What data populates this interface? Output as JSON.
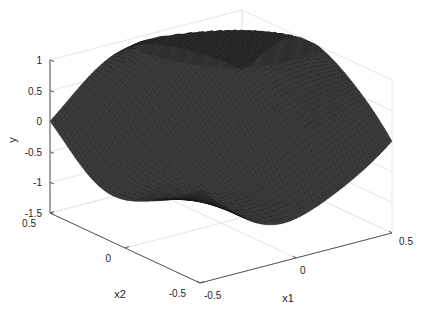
{
  "chart_data": {
    "type": "surface",
    "title": "",
    "xlabel": "x1",
    "ylabel": "x2",
    "zlabel": "y",
    "x1_range": [
      -0.5,
      0.5
    ],
    "x2_range": [
      -0.5,
      0.5
    ],
    "zlim": [
      -1.5,
      1
    ],
    "x1_ticks": [
      -0.5,
      0,
      0.5
    ],
    "x2_ticks": [
      -0.5,
      0,
      0.5
    ],
    "z_ticks": [
      -1.5,
      -1,
      -0.5,
      0,
      0.5,
      1
    ],
    "grid": true,
    "colormap": "gray-mesh",
    "mesh_resolution": 60,
    "surface_description": "Dark mesh surface; ~0 at corners (x1=-0.5,x2=0.5) and (x1=0.5,x2=-0.5); dips to about -1 near x2=0.25 front-left and near x1=0.25,x2=-0.25 front-right; peak ~0.9 near the back (x1≈0, x2≈0.4)",
    "sample_points": [
      {
        "x1": -0.5,
        "x2": 0.5,
        "y": 0.0
      },
      {
        "x1": -0.5,
        "x2": -0.5,
        "y": 0.0
      },
      {
        "x1": 0.5,
        "x2": -0.5,
        "y": 0.0
      },
      {
        "x1": 0.0,
        "x2": 0.5,
        "y": 0.9
      },
      {
        "x1": 0.25,
        "x2": -0.3,
        "y": -1.0
      },
      {
        "x1": -0.5,
        "x2": 0.1,
        "y": -1.0
      }
    ]
  },
  "labels": {
    "x1": "x1",
    "x2": "x2",
    "y": "y"
  },
  "tick_text": {
    "z": [
      "1",
      "0.5",
      "0",
      "-0.5",
      "-1",
      "-1.5"
    ],
    "x2": [
      "0.5",
      "0",
      "-0.5"
    ],
    "x1": [
      "-0.5",
      "0",
      "0.5"
    ]
  },
  "colors": {
    "axis": "#555555",
    "grid": "#e6e6e6",
    "mesh_line": "#111111",
    "mesh_fill": "#3a3a3a",
    "text": "#262626"
  }
}
